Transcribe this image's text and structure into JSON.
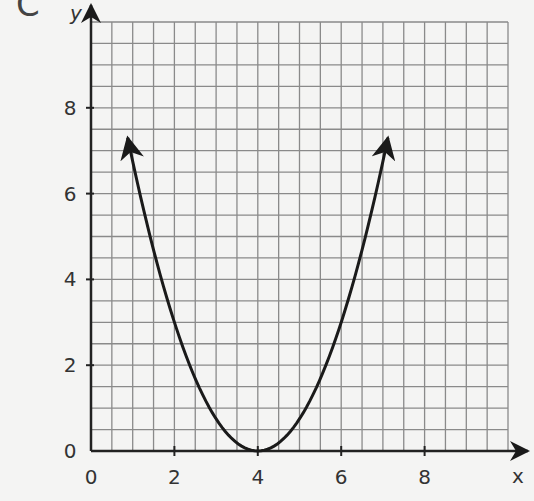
{
  "panel_label": "C",
  "colors": {
    "background": "#f4f4f3",
    "grid": "#8a8a8a",
    "axis": "#222222",
    "curve": "#1a1a1a",
    "text": "#333333"
  },
  "chart_data": {
    "type": "line",
    "title": "",
    "xlabel": "x",
    "ylabel": "y",
    "xlim": [
      0,
      10
    ],
    "ylim": [
      0,
      10
    ],
    "grid": true,
    "grid_step": 0.5,
    "x_ticks": [
      0,
      2,
      4,
      6,
      8
    ],
    "y_ticks": [
      0,
      2,
      4,
      6,
      8
    ],
    "x_tick_labels": [
      "0",
      "2",
      "4",
      "6",
      "8"
    ],
    "y_tick_labels": [
      "0",
      "2",
      "4",
      "6",
      "8"
    ],
    "series": [
      {
        "name": "parabola",
        "equation": "y = 0.75(x - 4)^2",
        "vertex": [
          4,
          0
        ],
        "x_range": [
          0.88,
          7.12
        ],
        "arrows_at_ends": true,
        "points": [
          {
            "x": 0.88,
            "y": 7.3
          },
          {
            "x": 1,
            "y": 6.75
          },
          {
            "x": 2,
            "y": 3
          },
          {
            "x": 3,
            "y": 0.75
          },
          {
            "x": 4,
            "y": 0
          },
          {
            "x": 5,
            "y": 0.75
          },
          {
            "x": 6,
            "y": 3
          },
          {
            "x": 7,
            "y": 6.75
          },
          {
            "x": 7.12,
            "y": 7.3
          }
        ]
      }
    ],
    "legend": null
  }
}
